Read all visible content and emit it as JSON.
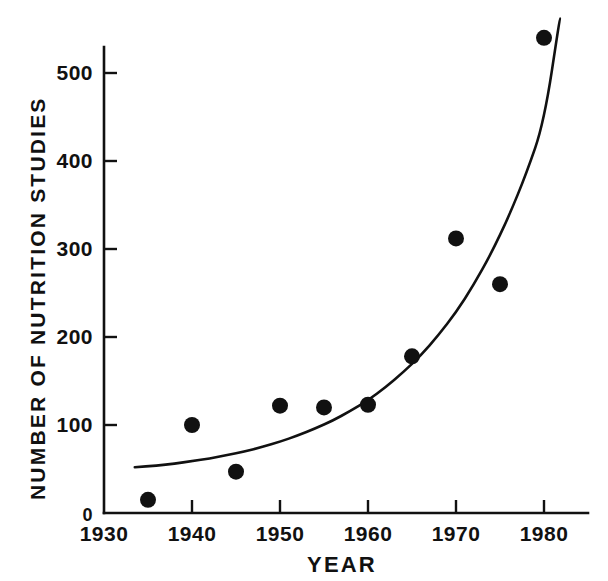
{
  "chart_data": {
    "type": "scatter",
    "title": "",
    "xlabel": "YEAR",
    "ylabel": "NUMBER OF NUTRITION STUDIES",
    "xlim": [
      1930,
      1985
    ],
    "ylim": [
      0,
      560
    ],
    "grid": false,
    "legend": "none",
    "x_major_ticks": [
      1930,
      1940,
      1950,
      1960,
      1970,
      1980
    ],
    "x_major_tick_labels": [
      "1930",
      "1940",
      "1950",
      "1960",
      "1970",
      "1980"
    ],
    "x_minor_ticks": [
      1935,
      1945,
      1955,
      1965,
      1975
    ],
    "y_major_ticks": [
      0,
      100,
      200,
      300,
      400,
      500
    ],
    "y_major_tick_labels": [
      "0",
      "100",
      "200",
      "300",
      "400",
      "500"
    ],
    "marker": "filled-circle",
    "marker_color": "#111111",
    "line_color": "#111111",
    "x": [
      1935,
      1940,
      1945,
      1950,
      1955,
      1960,
      1965,
      1970,
      1975,
      1980
    ],
    "values": [
      15,
      100,
      47,
      122,
      120,
      123,
      178,
      312,
      260,
      540
    ],
    "points": [
      {
        "year": 1935,
        "count": 15
      },
      {
        "year": 1940,
        "count": 100
      },
      {
        "year": 1945,
        "count": 47
      },
      {
        "year": 1950,
        "count": 122
      },
      {
        "year": 1955,
        "count": 120
      },
      {
        "year": 1960,
        "count": 123
      },
      {
        "year": 1965,
        "count": 178
      },
      {
        "year": 1970,
        "count": 312
      },
      {
        "year": 1975,
        "count": 260
      },
      {
        "year": 1980,
        "count": 540
      }
    ],
    "fit_curve": {
      "label": "exponential fit",
      "x_start": 1933.5,
      "x_end": 1981.8,
      "y_start": 52,
      "y_end": 562,
      "x": [
        1933.5,
        1936,
        1938,
        1940,
        1942,
        1944,
        1946,
        1948,
        1950,
        1952,
        1954,
        1956,
        1958,
        1960,
        1962,
        1964,
        1966,
        1968,
        1970,
        1972,
        1974,
        1976,
        1978,
        1980,
        1981.8
      ],
      "y": [
        52,
        54,
        56,
        59,
        62,
        66,
        70,
        75,
        81,
        88,
        96,
        105,
        116,
        128,
        143,
        160,
        179,
        202,
        228,
        259,
        295,
        337,
        386,
        444,
        562
      ]
    }
  }
}
